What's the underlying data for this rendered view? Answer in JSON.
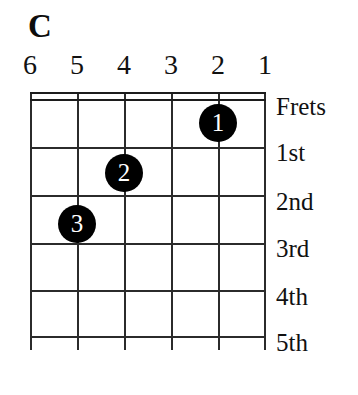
{
  "chord": {
    "name": "C",
    "instrument_strings": 6,
    "displayed_frets": 5
  },
  "string_numbers": [
    {
      "label": "6",
      "x": 30
    },
    {
      "label": "5",
      "x": 77
    },
    {
      "label": "4",
      "x": 124
    },
    {
      "label": "3",
      "x": 171
    },
    {
      "label": "2",
      "x": 218
    },
    {
      "label": "1",
      "x": 265
    }
  ],
  "grid": {
    "strings_x": [
      0,
      47,
      94,
      141,
      188,
      234
    ],
    "frets_y": [
      0,
      7,
      55,
      103,
      151,
      198,
      244
    ],
    "nut_y": [
      0,
      7
    ]
  },
  "finger_dots": [
    {
      "label": "1",
      "string": "2",
      "fret": "1st",
      "x": 188,
      "y": 31
    },
    {
      "label": "2",
      "string": "4",
      "fret": "2nd",
      "x": 94,
      "y": 81
    },
    {
      "label": "3",
      "string": "5",
      "fret": "3rd",
      "x": 47,
      "y": 132
    }
  ],
  "fret_labels": [
    {
      "label": "Frets",
      "y": 5
    },
    {
      "label": "1st",
      "y": 51
    },
    {
      "label": "2nd",
      "y": 100
    },
    {
      "label": "3rd",
      "y": 147
    },
    {
      "label": "4th",
      "y": 195
    },
    {
      "label": "5th",
      "y": 241
    }
  ],
  "colors": {
    "background": "#ffffff",
    "ink": "#111111",
    "grid": "#2b2b2b",
    "dot_fill": "#000000",
    "dot_text": "#ffffff"
  }
}
